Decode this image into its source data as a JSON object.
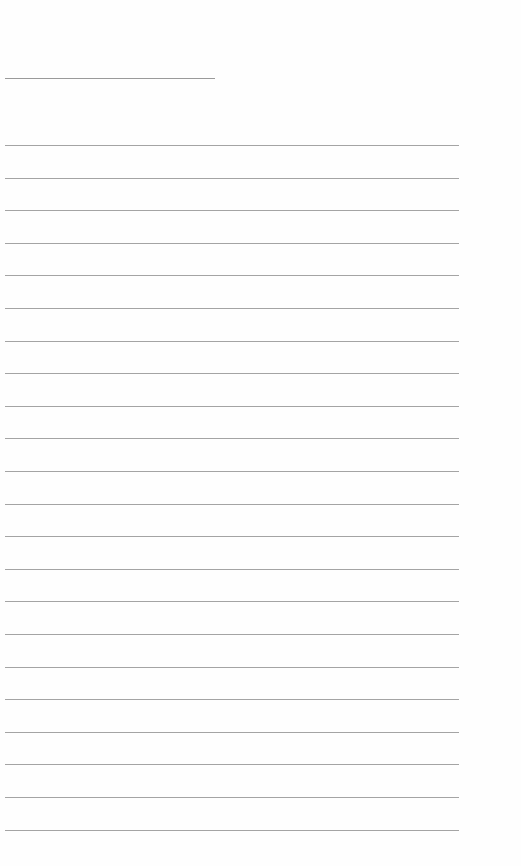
{
  "page": {
    "type": "blank-lined-sheet",
    "background_color": "#fefefe",
    "line_color": "#a4a4a4",
    "title_line": {
      "top": 78,
      "left": 5,
      "width": 210
    },
    "ruled_lines": {
      "count": 22,
      "first_top": 145,
      "spacing": 32.6,
      "left": 5,
      "width": 454
    }
  }
}
